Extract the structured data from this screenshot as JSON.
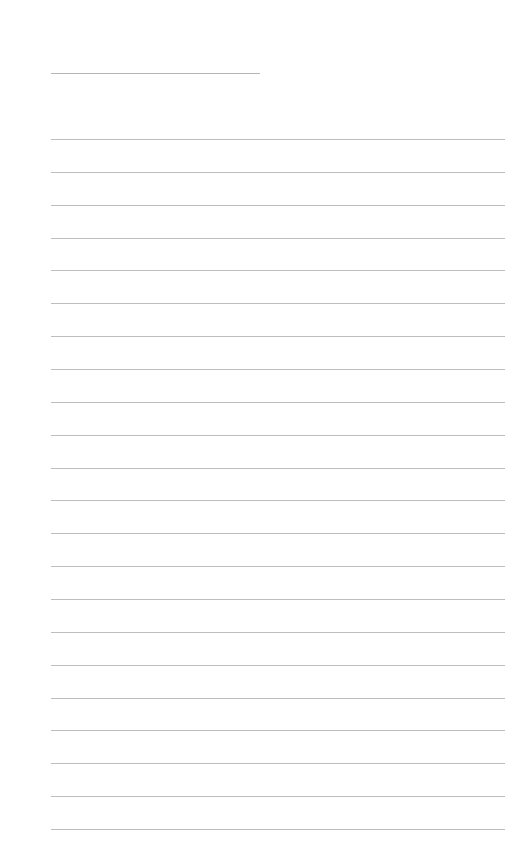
{
  "page": {
    "background": "#ffffff",
    "line_color": "#bdbdbd",
    "title_line": {
      "left": 51,
      "top": 73,
      "width": 209
    },
    "ruled_lines": {
      "count": 22,
      "left": 51,
      "width": 454,
      "first_top": 139,
      "spacing": 32.86
    }
  }
}
